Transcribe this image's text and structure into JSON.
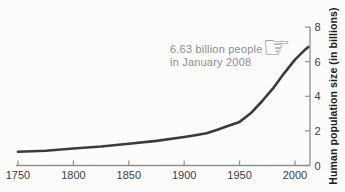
{
  "figure": {
    "background": "#fcfcfb"
  },
  "chart_data": {
    "type": "line",
    "title": "",
    "xlabel": "",
    "ylabel": "Human population size (in billions)",
    "x_ticks": [
      1750,
      1800,
      1850,
      1900,
      1950,
      2000
    ],
    "y_ticks": [
      0,
      2,
      4,
      6,
      8
    ],
    "xlim": [
      1750,
      2013
    ],
    "ylim": [
      0,
      8
    ],
    "grid": false,
    "legend": false,
    "axis_color": "#8f8f8f",
    "tick_label_color": "#3d3d3d",
    "ylabel_color": "#1c1c1c",
    "series": [
      {
        "name": "Human population",
        "color": "#3b3b3b",
        "points": [
          [
            1750,
            0.79
          ],
          [
            1775,
            0.85
          ],
          [
            1800,
            0.98
          ],
          [
            1825,
            1.1
          ],
          [
            1850,
            1.26
          ],
          [
            1875,
            1.42
          ],
          [
            1900,
            1.65
          ],
          [
            1910,
            1.75
          ],
          [
            1920,
            1.86
          ],
          [
            1930,
            2.07
          ],
          [
            1940,
            2.3
          ],
          [
            1950,
            2.52
          ],
          [
            1960,
            3.02
          ],
          [
            1970,
            3.7
          ],
          [
            1980,
            4.44
          ],
          [
            1990,
            5.31
          ],
          [
            2000,
            6.12
          ],
          [
            2008,
            6.63
          ],
          [
            2012,
            6.85
          ]
        ]
      }
    ],
    "annotation": {
      "line1": "6.63 billion people",
      "line2": "in January 2008",
      "color": "#8d8d8d",
      "icon": "pointing-hand-icon",
      "icon_glyph": "☞"
    }
  }
}
